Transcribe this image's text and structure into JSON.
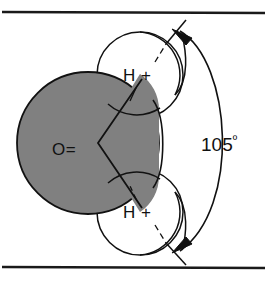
{
  "figure": {
    "type": "molecular-diagram",
    "frame": {
      "top_rule": true,
      "bottom_rule": true,
      "rule_color": "#1a1a1a"
    },
    "colors": {
      "oxygen_fill": "#808080",
      "hydrogen_fill": "#ffffff",
      "outline": "#111111",
      "background": "#ffffff",
      "text": "#111111"
    },
    "atoms": [
      {
        "id": "oxygen",
        "label": "O=",
        "element": "O",
        "charge": "=",
        "fill": "#808080",
        "cx": 88,
        "cy": 143,
        "r": 71
      },
      {
        "id": "hydrogen-top",
        "label": "H +",
        "element": "H",
        "charge": "+",
        "fill": "#ffffff",
        "cx": 140,
        "cy": 75,
        "r": 43
      },
      {
        "id": "hydrogen-bottom",
        "label": "H +",
        "element": "H",
        "charge": "+",
        "fill": "#ffffff",
        "cx": 140,
        "cy": 212,
        "r": 43
      }
    ],
    "bonds": {
      "vertex_x": 98,
      "vertex_y": 143,
      "top_end_x": 142,
      "top_end_y": 79,
      "bottom_end_x": 142,
      "bottom_end_y": 208
    },
    "angle": {
      "value": "105",
      "degree_symbol": "º",
      "label": "105º",
      "label_x": 225,
      "label_y": 148,
      "arc_from": "hydrogen-top",
      "arc_to": "hydrogen-bottom",
      "arrow_top": "up-left",
      "arrow_bottom": "down-left"
    }
  }
}
